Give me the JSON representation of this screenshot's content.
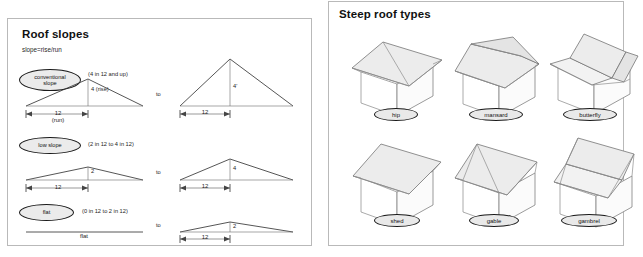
{
  "left_panel": {
    "title": "Roof slopes",
    "formula": "slope=rise/run",
    "rows": [
      {
        "chip": "conventional\nslope",
        "range": "(4 in 12 and up)",
        "rise_label": "4 (rise)",
        "run_label": "12\n(run)",
        "to_label": "to",
        "right_rise_label": "4'",
        "right_run_label": "12"
      },
      {
        "chip": "low slope",
        "range": "(2 in 12 to 4 in 12)",
        "rise_label": "2",
        "run_label": "12",
        "to_label": "to",
        "right_rise_label": "4",
        "right_run_label": "12"
      },
      {
        "chip": "flat",
        "range": "(0 in 12 to 2 in 12)",
        "rise_label": "",
        "run_label": "flat",
        "to_label": "to",
        "right_rise_label": "2",
        "right_run_label": "12"
      }
    ]
  },
  "right_panel": {
    "title": "Steep roof types",
    "types": [
      {
        "name": "hip"
      },
      {
        "name": "mansard"
      },
      {
        "name": "butterfly"
      },
      {
        "name": "shed"
      },
      {
        "name": "gable"
      },
      {
        "name": "gambrel"
      }
    ]
  },
  "colors": {
    "panel_border": "#b9b9b9",
    "line": "#2b2b2b",
    "roof_fill": "#ececec",
    "chip_fill": "#ebebeb"
  }
}
